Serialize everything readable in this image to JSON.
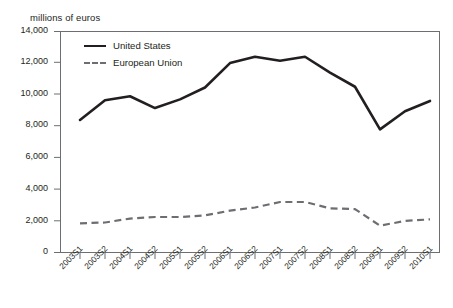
{
  "figure": {
    "unit_label": "millions of euros"
  },
  "legend": {
    "position": "inside-top-left",
    "entries": [
      {
        "label": "United States",
        "style": "solid",
        "color": "#231f20"
      },
      {
        "label": "European Union",
        "style": "dashed",
        "color": "#6d6e71"
      }
    ]
  },
  "axes": {
    "y_ticks": [
      "0",
      "2,000",
      "4,000",
      "6,000",
      "8,000",
      "10,000",
      "12,000",
      "14,000"
    ],
    "x_ticks": [
      "2003S1",
      "2003S2",
      "2004S1",
      "2004S2",
      "2005S1",
      "2005S2",
      "2006S1",
      "2006S2",
      "2007S1",
      "2007S2",
      "2008S1",
      "2008S2",
      "2009S1",
      "2009S2",
      "2010S1"
    ]
  },
  "chart_data": {
    "type": "line",
    "title": "",
    "subtitle": "",
    "xlabel": "",
    "ylabel": "millions of euros",
    "ylim": [
      0,
      14000
    ],
    "ytick_step": 2000,
    "grid": false,
    "legend_position": "inside-top-left",
    "categories": [
      "2003S1",
      "2003S2",
      "2004S1",
      "2004S2",
      "2005S1",
      "2005S2",
      "2006S1",
      "2006S2",
      "2007S1",
      "2007S2",
      "2008S1",
      "2008S2",
      "2009S1",
      "2009S2",
      "2010S1"
    ],
    "series": [
      {
        "name": "United States",
        "style": "solid",
        "color": "#231f20",
        "values": [
          8400,
          9650,
          9900,
          9150,
          9700,
          10450,
          12000,
          12400,
          12150,
          12400,
          11400,
          10500,
          7800,
          8950,
          9600
        ]
      },
      {
        "name": "European Union",
        "style": "dashed",
        "color": "#6d6e71",
        "values": [
          1850,
          1900,
          2150,
          2250,
          2250,
          2350,
          2650,
          2850,
          3200,
          3200,
          2800,
          2750,
          1700,
          2000,
          2100
        ]
      }
    ]
  }
}
